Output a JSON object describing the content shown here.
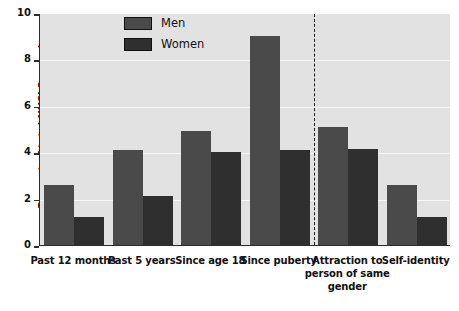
{
  "chart_data": {
    "type": "bar",
    "title": "",
    "xlabel": "",
    "ylabel": "Percent of total NHSLS sample",
    "ylim": [
      0,
      10
    ],
    "yticks": [
      0,
      2,
      4,
      6,
      8,
      10
    ],
    "grid": true,
    "legend_position": "top-left-center",
    "categories": [
      "Past 12 months",
      "Past 5 years",
      "Since age 18",
      "Since puberty",
      "Attraction to person of same gender",
      "Self-identity"
    ],
    "series": [
      {
        "name": "Men",
        "color": "#4a4a4a",
        "values": [
          2.6,
          4.1,
          4.9,
          9.0,
          5.1,
          2.6
        ]
      },
      {
        "name": "Women",
        "color": "#2f2f2f",
        "values": [
          1.2,
          2.1,
          4.0,
          4.1,
          4.15,
          1.2
        ]
      }
    ],
    "annotations": [
      {
        "type": "vertical-dashed-line",
        "after_category": "Since puberty"
      }
    ]
  },
  "axis": {
    "y_title": "Percent of total NHSLS sample",
    "y_tick_labels": [
      "10",
      "8",
      "6",
      "4",
      "2",
      "0"
    ]
  },
  "legend": {
    "items": [
      {
        "label": "Men"
      },
      {
        "label": "Women"
      }
    ]
  },
  "x_categories": [
    {
      "label": "Past 12 months"
    },
    {
      "label": "Past 5 years"
    },
    {
      "label": "Since age 18"
    },
    {
      "label": "Since puberty"
    },
    {
      "label": "Attraction to person of same gender"
    },
    {
      "label": "Self-identity"
    }
  ],
  "colors": {
    "men": "#4a4a4a",
    "women": "#2f2f2f",
    "plot_background": "#e2e2e2",
    "gridline": "#f7f7f7",
    "axis": "#2b2b2b"
  }
}
